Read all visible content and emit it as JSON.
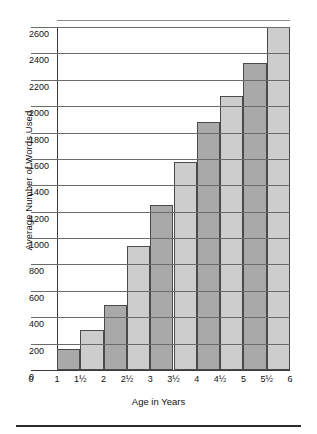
{
  "chart_data": {
    "type": "bar",
    "title": "",
    "xlabel": "Age in Years",
    "ylabel": "Average Number of Words Used",
    "categories": [
      "1",
      "1½",
      "2",
      "2½",
      "3",
      "3½",
      "4",
      "4½",
      "5",
      "5½",
      "6"
    ],
    "values": [
      0,
      160,
      300,
      490,
      940,
      1250,
      1580,
      1880,
      2080,
      2330,
      2600
    ],
    "bar_colors": [
      "#a9a9a9",
      "#cdcdcd",
      "#a9a9a9",
      "#cdcdcd",
      "#a9a9a9",
      "#cdcdcd",
      "#a9a9a9",
      "#cdcdcd",
      "#a9a9a9",
      "#cdcdcd"
    ],
    "ylim": [
      0,
      2600
    ],
    "ytick_labels": [
      "0",
      "200",
      "400",
      "600",
      "800",
      "1000",
      "1200",
      "1400",
      "1600",
      "1800",
      "2000",
      "2200",
      "2400",
      "2600"
    ],
    "ytick_values": [
      0,
      200,
      400,
      600,
      800,
      1000,
      1200,
      1400,
      1600,
      1800,
      2000,
      2200,
      2400,
      2600
    ],
    "xtick_labels": [
      "0",
      "1",
      "1½",
      "2",
      "2½",
      "3",
      "3½",
      "4",
      "4½",
      "5",
      "5½",
      "6"
    ],
    "grid": true,
    "legend": "none",
    "series": [
      {
        "name": "Average Number of Words Used",
        "points": [
          {
            "x": "1½",
            "y": 160
          },
          {
            "x": "2",
            "y": 300
          },
          {
            "x": "2½",
            "y": 490
          },
          {
            "x": "3",
            "y": 940
          },
          {
            "x": "3½",
            "y": 1250
          },
          {
            "x": "4",
            "y": 1580
          },
          {
            "x": "4½",
            "y": 1880
          },
          {
            "x": "5",
            "y": 2080
          },
          {
            "x": "5½",
            "y": 2330
          },
          {
            "x": "6",
            "y": 2600
          }
        ]
      }
    ]
  }
}
